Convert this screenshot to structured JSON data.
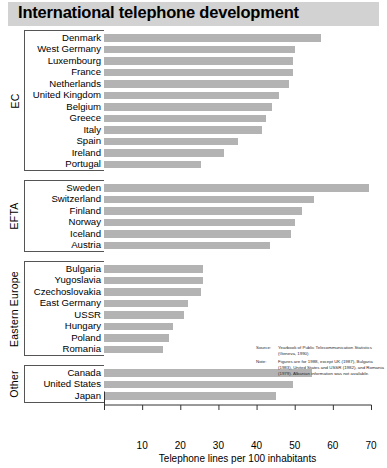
{
  "title": "International telephone development",
  "chart_data": {
    "type": "bar",
    "orientation": "horizontal",
    "title": "International telephone development",
    "xlabel": "Telephone lines per 100 inhabitants",
    "ylabel": "",
    "xlim": [
      0,
      70
    ],
    "xticks": [
      0,
      10,
      20,
      30,
      40,
      50,
      60,
      70
    ],
    "xtick_labels": [
      "",
      "10",
      "20",
      "30",
      "40",
      "50",
      "60",
      "70"
    ],
    "grid": false,
    "legend": "none",
    "bar_color": "#b3b3b3",
    "groups": [
      {
        "name": "EC",
        "categories": [
          "Denmark",
          "West Germany",
          "Luxembourg",
          "France",
          "Netherlands",
          "United Kingdom",
          "Belgium",
          "Greece",
          "Italy",
          "Spain",
          "Ireland",
          "Portugal"
        ],
        "values": [
          57.0,
          50.0,
          49.5,
          49.5,
          48.5,
          46.0,
          44.0,
          42.5,
          41.5,
          35.0,
          31.5,
          25.5
        ]
      },
      {
        "name": "EFTA",
        "categories": [
          "Sweden",
          "Switzerland",
          "Finland",
          "Norway",
          "Iceland",
          "Austria"
        ],
        "values": [
          69.5,
          55.0,
          52.0,
          50.0,
          49.0,
          43.5
        ]
      },
      {
        "name": "Eastern Europe",
        "categories": [
          "Bulgaria",
          "Yugoslavia",
          "Czechoslovakia",
          "East Germany",
          "USSR",
          "Hungary",
          "Poland",
          "Romania"
        ],
        "values": [
          26.0,
          26.0,
          25.5,
          22.0,
          21.0,
          18.0,
          17.0,
          15.5
        ]
      },
      {
        "name": "Other",
        "categories": [
          "Canada",
          "United States",
          "Japan"
        ],
        "values": [
          54.5,
          49.5,
          45.0
        ]
      }
    ]
  },
  "source_note": {
    "source_key": "Source:",
    "source_value": "Yearbook of Public Telecommunication Statistics (Geneva, 1990)",
    "note_key": "Note:",
    "note_value": "Figures are for 1988, except UK (1987), Bulgaria (1983), United States and USSR (1982), and Romania (1979). Albanian information was not available."
  }
}
